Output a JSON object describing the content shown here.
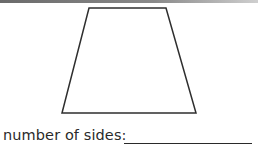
{
  "worksheet": {
    "shape": {
      "name": "trapezoid",
      "points": "89,8 166,8 196,113 62,113",
      "stroke": "#2e2e2e"
    },
    "prompt_label": "number of sides:",
    "answer_value": ""
  }
}
